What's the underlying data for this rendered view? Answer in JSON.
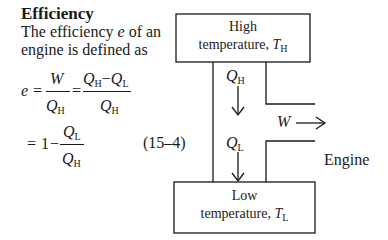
{
  "heading": "Efficiency",
  "paragraph": {
    "line1_pre": "The efficiency ",
    "line1_var": "e",
    "line1_post": " of an",
    "line2": "engine is defined as"
  },
  "equation": {
    "lhs": "e",
    "eq": "=",
    "W": "W",
    "Q": "Q",
    "sub_H": "H",
    "sub_L": "L",
    "minus": "−",
    "one": "1",
    "number": "(15–4)"
  },
  "diagram": {
    "high_box": {
      "line1": "High",
      "line2": "temperature, ",
      "T": "T",
      "sub": "H"
    },
    "low_box": {
      "line1": "Low",
      "line2": "temperature, ",
      "T": "T",
      "sub": "L"
    },
    "heat_in": {
      "Q": "Q",
      "sub": "H"
    },
    "heat_out": {
      "Q": "Q",
      "sub": "L"
    },
    "work": "W",
    "engine_label": "Engine",
    "line_color": "#1a1a1a"
  }
}
